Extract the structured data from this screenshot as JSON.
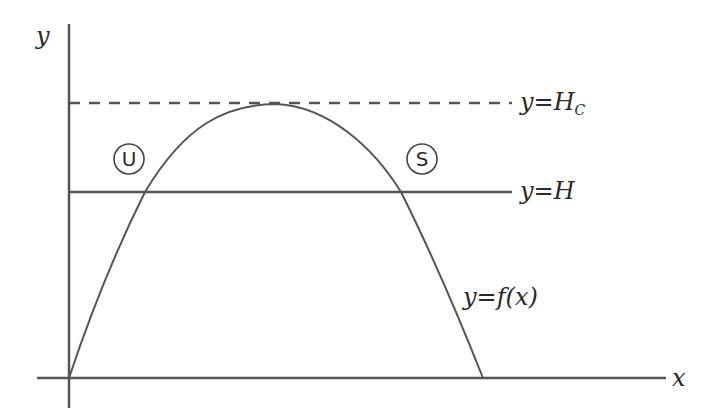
{
  "diagram": {
    "axes": {
      "x_label": "x",
      "y_label": "y"
    },
    "lines": {
      "critical": {
        "label_y": "y",
        "label_eq": "=",
        "label_var": "H",
        "label_sub": "C",
        "style": "dashed"
      },
      "level": {
        "label_y": "y",
        "label_eq": "=",
        "label_var": "H",
        "style": "solid"
      }
    },
    "curve": {
      "label": "y=f(x)",
      "label_y": "y",
      "label_rest": "=f(x)"
    },
    "points": {
      "unstable": {
        "label": "U",
        "meaning": "unstable"
      },
      "stable": {
        "label": "S",
        "meaning": "stable"
      }
    },
    "colors": {
      "stroke": "#555555",
      "text": "#2a2a2a",
      "background": "#ffffff"
    }
  }
}
